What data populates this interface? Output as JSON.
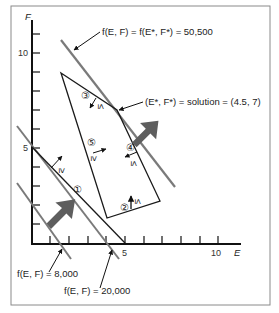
{
  "figure": {
    "top_cropped_caption": "(continued from previous page — cropped)",
    "axes": {
      "x_label": "E",
      "y_label": "F",
      "x_ticks": [
        {
          "value": 5,
          "label": "5"
        },
        {
          "value": 10,
          "label": "10"
        }
      ],
      "y_ticks": [
        {
          "value": 5,
          "label": "5"
        },
        {
          "value": 10,
          "label": "10"
        }
      ],
      "x_range": [
        0,
        11
      ],
      "y_range": [
        0,
        12
      ]
    },
    "annotations": {
      "optimal_line": "f(E, F) = f(E*, F*) = 50,500",
      "solution": "(E*, F*) = solution = (4.5, 7)",
      "iso_8000": "f(E, F) = 8,000",
      "iso_20000": "f(E, F) = 20,000"
    },
    "constraints": [
      {
        "id": "1",
        "label": "①",
        "sign": "≥"
      },
      {
        "id": "2",
        "label": "②",
        "sign": "≤"
      },
      {
        "id": "3",
        "label": "③",
        "sign": "≤"
      },
      {
        "id": "4",
        "label": "④",
        "sign": "≤"
      },
      {
        "id": "5",
        "label": "⑤",
        "sign": "≥"
      }
    ],
    "colors": {
      "axis": "#111111",
      "constraint": "#1a1a1a",
      "isoline": "#7a7a7a",
      "big_arrow": "#5e5e5e",
      "frame": "#8a8a8a"
    }
  }
}
